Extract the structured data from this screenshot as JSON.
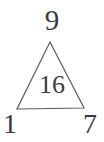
{
  "figure": {
    "type": "triangle-number-puzzle",
    "background_color": "#ffffff",
    "stroke_color": "#5a5a60",
    "text_color": "#3a3a40",
    "labels": {
      "apex": "9",
      "inner": "16",
      "bottom_left": "1",
      "bottom_right": "7"
    },
    "geometry": {
      "apex_point": "50,42",
      "bottom_left_point": "17,109",
      "bottom_right_point": "84,108",
      "polygon_points": "50,42 84,108 17,109",
      "stroke_width": "1.2"
    }
  }
}
